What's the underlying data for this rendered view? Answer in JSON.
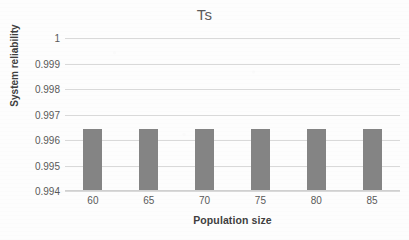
{
  "chart_data": {
    "type": "bar",
    "title": "Ts",
    "xlabel": "Population size",
    "ylabel": "System reliability",
    "categories": [
      "60",
      "65",
      "70",
      "75",
      "80",
      "85"
    ],
    "values": [
      0.99645,
      0.99645,
      0.99645,
      0.99644,
      0.99643,
      0.99643
    ],
    "series": [
      {
        "name": "Ts",
        "values": [
          0.99645,
          0.99645,
          0.99645,
          0.99644,
          0.99643,
          0.99643
        ]
      }
    ],
    "ylim": [
      0.994,
      1
    ],
    "ytick_labels": [
      "1",
      "0.999",
      "0.998",
      "0.997",
      "0.996",
      "0.995",
      "0.994"
    ],
    "ytick_values": [
      1,
      0.999,
      0.998,
      0.997,
      0.996,
      0.995,
      0.994
    ],
    "grid": true,
    "legend": "none",
    "bar_color": "#848484",
    "gridline_color": "#d9d9d9",
    "background_color": "#ffffff",
    "text_color": "#595959"
  }
}
